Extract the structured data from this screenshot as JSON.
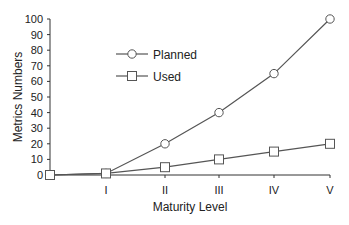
{
  "chart_data": {
    "type": "line",
    "title": "",
    "xlabel": "Maturity Level",
    "ylabel": "Metrics Numbers",
    "categories": [
      "",
      "I",
      "II",
      "III",
      "IV",
      "V"
    ],
    "ylim": [
      0,
      100
    ],
    "yticks": [
      0,
      10,
      20,
      30,
      40,
      50,
      60,
      70,
      80,
      90,
      100
    ],
    "grid": false,
    "legend_position": "upper-left-inside",
    "series": [
      {
        "name": "Planned",
        "marker": "circle",
        "values": [
          0,
          1,
          20,
          40,
          65,
          100
        ]
      },
      {
        "name": "Used",
        "marker": "square",
        "values": [
          0,
          1,
          5,
          10,
          15,
          20
        ]
      }
    ]
  },
  "colors": {
    "line": "#555555",
    "axis": "#333333",
    "marker_fill": "#ffffff"
  }
}
